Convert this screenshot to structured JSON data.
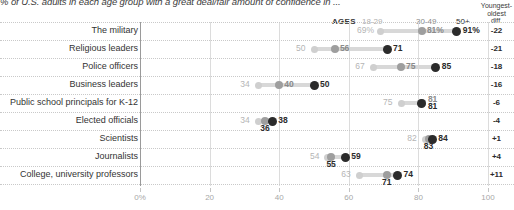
{
  "subtitle": "% of U.S. adults in each age group with a great deal/fair amount of confidence in ...",
  "header": {
    "ages_label": "AGES",
    "col_1829": "18-29",
    "col_3049": "30-49",
    "col_50": "50+",
    "diff_label_line1": "Youngest-",
    "diff_label_line2": "oldest",
    "diff_label_line3": "diff."
  },
  "colors": {
    "age_18_29": "#cfcfcf",
    "age_30_49": "#9e9e9e",
    "age_50_plus": "#2b2b2b",
    "connector": "#d8d8d8",
    "gridline": "#dcdcdc"
  },
  "chart_data": {
    "type": "scatter",
    "title": "",
    "subtitle": "% of U.S. adults in each age group with a great deal/fair amount of confidence in ...",
    "xlabel": "",
    "ylabel": "",
    "xlim": [
      0,
      100
    ],
    "grid": true,
    "legend_position": "top-right",
    "xticks": [
      "0%",
      "20",
      "40",
      "60",
      "80",
      "100"
    ],
    "xtick_values": [
      0,
      20,
      40,
      60,
      80,
      100
    ],
    "series": [
      {
        "name": "18-29",
        "values": [
          69,
          50,
          67,
          34,
          75,
          34,
          82,
          54,
          63
        ]
      },
      {
        "name": "30-49",
        "values": [
          81,
          56,
          75,
          40,
          81,
          36,
          83,
          55,
          71
        ]
      },
      {
        "name": "50+",
        "values": [
          91,
          71,
          85,
          50,
          81,
          38,
          84,
          59,
          74
        ]
      }
    ],
    "categories": [
      "The military",
      "Religious leaders",
      "Police officers",
      "Business leaders",
      "Public school principals for K-12",
      "Elected officials",
      "Scientists",
      "Journalists",
      "College, university professors"
    ],
    "diffs": [
      -22,
      -21,
      -18,
      -16,
      -6,
      -4,
      1,
      4,
      11
    ]
  },
  "rows": [
    {
      "label": "The military",
      "v1829": 69,
      "v3049": 81,
      "v50": 91,
      "l1829": "69%",
      "l3049": "81%",
      "l50": "91%",
      "diff": "-22"
    },
    {
      "label": "Religious leaders",
      "v1829": 50,
      "v3049": 56,
      "v50": 71,
      "l1829": "50",
      "l3049": "56",
      "l50": "71",
      "diff": "-21"
    },
    {
      "label": "Police officers",
      "v1829": 67,
      "v3049": 75,
      "v50": 85,
      "l1829": "67",
      "l3049": "75",
      "l50": "85",
      "diff": "-18"
    },
    {
      "label": "Business leaders",
      "v1829": 34,
      "v3049": 40,
      "v50": 50,
      "l1829": "34",
      "l3049": "40",
      "l50": "50",
      "diff": "-16"
    },
    {
      "label": "Public school principals for K-12",
      "v1829": 75,
      "v3049": 81,
      "v50": 81,
      "l1829": "75",
      "l3049": "81",
      "l50": "81",
      "diff": "-6"
    },
    {
      "label": "Elected officials",
      "v1829": 34,
      "v3049": 36,
      "v50": 38,
      "l1829": "34",
      "l3049": "36",
      "l50": "38",
      "diff": "-4"
    },
    {
      "label": "Scientists",
      "v1829": 82,
      "v3049": 83,
      "v50": 84,
      "l1829": "82",
      "l3049": "83",
      "l50": "84",
      "diff": "+1"
    },
    {
      "label": "Journalists",
      "v1829": 54,
      "v3049": 55,
      "v50": 59,
      "l1829": "54",
      "l3049": "55",
      "l50": "59",
      "diff": "+4"
    },
    {
      "label": "College, university professors",
      "v1829": 63,
      "v3049": 71,
      "v50": 74,
      "l1829": "63",
      "l3049": "71",
      "l50": "74",
      "diff": "+11"
    }
  ],
  "xaxis": {
    "ticks": [
      "0%",
      "20",
      "40",
      "60",
      "80",
      "100"
    ],
    "values": [
      0,
      20,
      40,
      60,
      80,
      100
    ]
  }
}
